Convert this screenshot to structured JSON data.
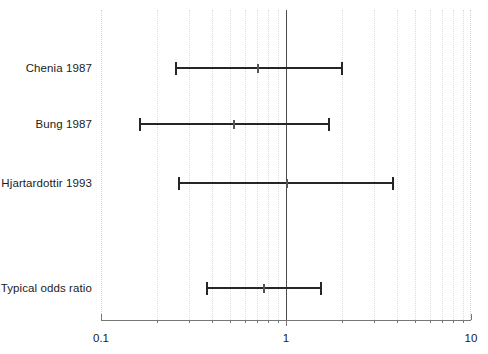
{
  "chart_data": {
    "type": "forest",
    "title": "",
    "xlabel": "",
    "ylabel": "",
    "scale": "log",
    "xlim": [
      0.1,
      10
    ],
    "xticks": [
      0.1,
      1,
      10
    ],
    "xticklabels": [
      "0.1",
      "1",
      "10"
    ],
    "minor_ticks": [
      0.2,
      0.3,
      0.4,
      0.5,
      0.6,
      0.7,
      0.8,
      0.9,
      2,
      3,
      4,
      5,
      6,
      7,
      8,
      9
    ],
    "grid": true,
    "null_value": 1,
    "legend": "none",
    "rows": [
      {
        "label": "Chenia 1987",
        "estimate": 0.7,
        "ci_low": 0.25,
        "ci_high": 2.0,
        "is_summary": false
      },
      {
        "label": "Bung 1987",
        "estimate": 0.52,
        "ci_low": 0.16,
        "ci_high": 1.7,
        "is_summary": false
      },
      {
        "label": "Hjartardottir 1993",
        "estimate": 1.0,
        "ci_low": 0.26,
        "ci_high": 3.8,
        "is_summary": false
      },
      {
        "label": "Typical odds ratio",
        "estimate": 0.75,
        "ci_low": 0.37,
        "ci_high": 1.55,
        "is_summary": true
      }
    ]
  },
  "colors": {
    "bar": "#262626",
    "marker": "#555555",
    "null_line": "#4a4a4a",
    "grid": "#dcdcdc",
    "axis": "#777777",
    "text": "#1c1c1c",
    "background": "#ffffff"
  },
  "layout": {
    "row_y": [
      68,
      124,
      183,
      288
    ],
    "plot_left": 101,
    "plot_right": 471,
    "axis_y": 320
  }
}
